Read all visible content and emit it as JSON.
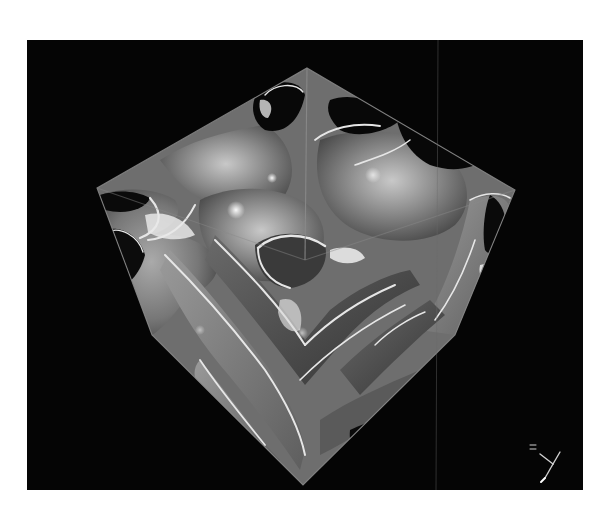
{
  "figure": {
    "kind": "3d-isosurface-render",
    "colors": {
      "page_background": "#ffffff",
      "panel_background": "#050505",
      "surface_mid": "#7a7a7a",
      "surface_light": "#b8b8b8",
      "surface_dark": "#3a3a3a",
      "edge_highlight": "#e8e8e8",
      "cube_wireframe": "#8a8a8a"
    },
    "panel": {
      "x": 27,
      "y": 40,
      "width": 556,
      "height": 450
    },
    "cube_vertices": {
      "top": [
        307,
        68
      ],
      "upper_left": [
        97,
        188
      ],
      "upper_right": [
        515,
        190
      ],
      "lower_left": [
        152,
        335
      ],
      "lower_right": [
        455,
        335
      ],
      "bottom": [
        303,
        485
      ]
    },
    "axis_triad": {
      "x": 548,
      "y": 462
    }
  }
}
